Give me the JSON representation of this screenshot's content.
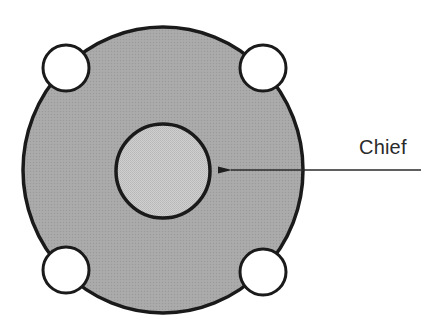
{
  "diagram": {
    "title": "",
    "labels": {
      "chief": "Chief"
    },
    "shapes": {
      "outer_disc": {
        "cx": 163,
        "cy": 170,
        "rx": 140,
        "ry": 143,
        "fill": "#a6a6a6",
        "stroke": "#1a1a1a"
      },
      "inner_disc": {
        "cx": 163,
        "cy": 171,
        "r": 47,
        "fill": "#c9c9c9",
        "stroke": "#1a1a1a"
      },
      "corner_circles": [
        {
          "name": "top-left",
          "cx": 66,
          "cy": 68,
          "r": 23
        },
        {
          "name": "top-right",
          "cx": 263,
          "cy": 68,
          "r": 23
        },
        {
          "name": "bottom-left",
          "cx": 66,
          "cy": 270,
          "r": 23
        },
        {
          "name": "bottom-right",
          "cx": 263,
          "cy": 272,
          "r": 23
        }
      ],
      "arrow": {
        "from_x": 421,
        "to_x": 217,
        "y": 170,
        "color": "#2a2a2a"
      }
    },
    "colors": {
      "outer_fill": "#a6a6a6",
      "inner_fill": "#c9c9c9",
      "stroke": "#1a1a1a",
      "background": "#ffffff"
    }
  }
}
